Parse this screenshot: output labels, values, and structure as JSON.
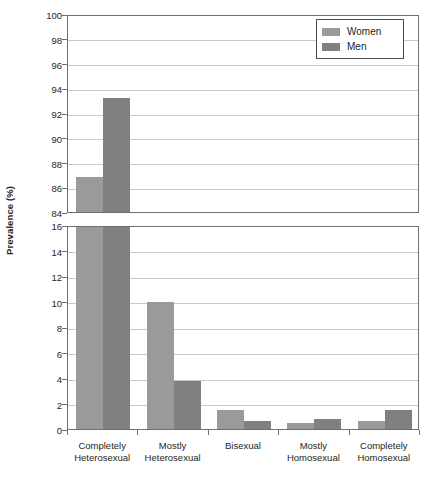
{
  "chart_data": {
    "type": "bar",
    "title": "",
    "xlabel": "",
    "ylabel": "Prevalence (%)",
    "grid": true,
    "legend_position": "top-right",
    "broken_axis": true,
    "categories": [
      "Completely\nHeterosexual",
      "Mostly\nHeterosexual",
      "Bisexual",
      "Mostly\nHomosexual",
      "Completely\nHomosexual"
    ],
    "category_lines": [
      [
        "Completely",
        "Heterosexual"
      ],
      [
        "Mostly",
        "Heterosexual"
      ],
      [
        "Bisexual",
        ""
      ],
      [
        "Mostly",
        "Homosexual"
      ],
      [
        "Completely",
        "Homosexual"
      ]
    ],
    "series": [
      {
        "name": "Women",
        "color": "#9a9a9a",
        "values": [
          86.8,
          10.0,
          1.5,
          0.5,
          0.6
        ]
      },
      {
        "name": "Men",
        "color": "#808080",
        "values": [
          93.2,
          3.8,
          0.6,
          0.8,
          1.5
        ]
      }
    ],
    "upper_panel": {
      "ylim": [
        84,
        100
      ],
      "ticks": [
        84,
        86,
        88,
        90,
        92,
        94,
        96,
        98,
        100
      ]
    },
    "lower_panel": {
      "ylim": [
        0,
        16
      ],
      "ticks": [
        0,
        2,
        4,
        6,
        8,
        10,
        12,
        14,
        16
      ]
    }
  },
  "legend": {
    "items": [
      {
        "label": "Women"
      },
      {
        "label": "Men"
      }
    ]
  },
  "axis": {
    "ylabel": "Prevalence (%)"
  }
}
